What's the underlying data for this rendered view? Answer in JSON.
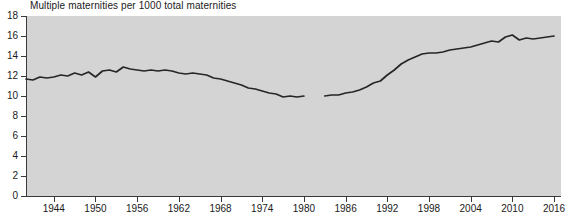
{
  "chart_data": {
    "type": "line",
    "title": "Multiple maternities per 1000 total maternities",
    "xlabel": "",
    "ylabel": "",
    "xlim": [
      1940,
      2017
    ],
    "ylim": [
      0,
      18
    ],
    "grid": false,
    "legend": null,
    "x_ticks": [
      1944,
      1950,
      1956,
      1962,
      1968,
      1974,
      1980,
      1986,
      1992,
      1998,
      2004,
      2010,
      2016
    ],
    "y_ticks": [
      0,
      2,
      4,
      6,
      8,
      10,
      12,
      14,
      16,
      18
    ],
    "line_color": "#262626",
    "plot_bg_color": "#d4d4d4",
    "page_bg_color": "#ffffff",
    "series": [
      {
        "name": "Multiple maternities per 1000 total maternities",
        "x": [
          1940,
          1941,
          1942,
          1943,
          1944,
          1945,
          1946,
          1947,
          1948,
          1949,
          1950,
          1951,
          1952,
          1953,
          1954,
          1955,
          1956,
          1957,
          1958,
          1959,
          1960,
          1961,
          1962,
          1963,
          1964,
          1965,
          1966,
          1967,
          1968,
          1969,
          1970,
          1971,
          1972,
          1973,
          1974,
          1975,
          1976,
          1977,
          1978,
          1979,
          1980
        ],
        "values": [
          11.7,
          11.6,
          11.9,
          11.8,
          11.9,
          12.1,
          12.0,
          12.3,
          12.1,
          12.4,
          11.9,
          12.5,
          12.6,
          12.4,
          12.9,
          12.7,
          12.6,
          12.5,
          12.6,
          12.5,
          12.6,
          12.5,
          12.3,
          12.2,
          12.3,
          12.2,
          12.1,
          11.8,
          11.7,
          11.5,
          11.3,
          11.1,
          10.8,
          10.7,
          10.5,
          10.3,
          10.2,
          9.9,
          10.0,
          9.9,
          10.0
        ]
      },
      {
        "name": "Multiple maternities per 1000 total maternities (continued)",
        "x": [
          1983,
          1984,
          1985,
          1986,
          1987,
          1988,
          1989,
          1990,
          1991,
          1992,
          1993,
          1994,
          1995,
          1996,
          1997,
          1998,
          1999,
          2000,
          2001,
          2002,
          2003,
          2004,
          2005,
          2006,
          2007,
          2008,
          2009,
          2010,
          2011,
          2012,
          2013,
          2014,
          2015,
          2016
        ],
        "values": [
          10.0,
          10.1,
          10.1,
          10.3,
          10.4,
          10.6,
          10.9,
          11.3,
          11.5,
          12.1,
          12.6,
          13.2,
          13.6,
          13.9,
          14.2,
          14.3,
          14.3,
          14.4,
          14.6,
          14.7,
          14.8,
          14.9,
          15.1,
          15.3,
          15.5,
          15.4,
          15.9,
          16.1,
          15.6,
          15.8,
          15.7,
          15.8,
          15.9,
          16.0
        ]
      }
    ]
  }
}
